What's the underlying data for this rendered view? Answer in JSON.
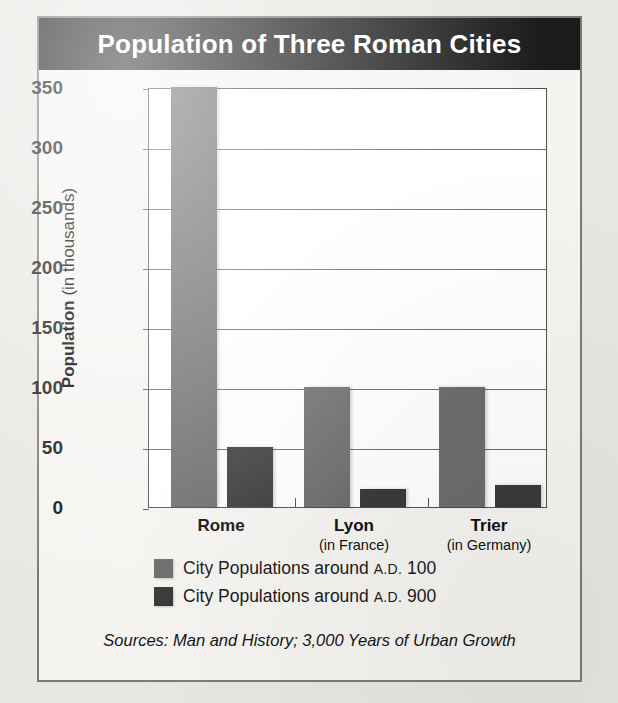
{
  "figure": {
    "title": "Population of Three Roman Cities",
    "source_note": "Sources: Man and History; 3,000 Years of Urban Growth",
    "colors": {
      "banner_background": "#1b1b1b",
      "banner_text": "#ffffff",
      "series_ad100": "#6d6c6b",
      "series_ad900": "#3b3a39",
      "frame_border": "#7c7a76",
      "plot_background": "#ffffff",
      "gridline": "#6d6b68",
      "page_background": "#e9e7e3",
      "figure_background": "#f5f4f1"
    }
  },
  "axis": {
    "y_title_bold": "Population",
    "y_title_plain": "(in thousands)",
    "y_ticks": [
      "0",
      "50",
      "100",
      "150",
      "200",
      "250",
      "300",
      "350"
    ]
  },
  "legend": {
    "items": [
      {
        "swatch": "light",
        "prefix": "City Populations around ",
        "era": "A.D.",
        "year": " 100"
      },
      {
        "swatch": "dark",
        "prefix": "City Populations around ",
        "era": "A.D.",
        "year": " 900"
      }
    ]
  },
  "categories": [
    {
      "name": "Rome",
      "sub": ""
    },
    {
      "name": "Lyon",
      "sub": "(in France)"
    },
    {
      "name": "Trier",
      "sub": "(in Germany)"
    }
  ],
  "chart_data": {
    "type": "bar",
    "title": "Population of Three Roman Cities",
    "xlabel": "",
    "ylabel": "Population (in thousands)",
    "ylim": [
      0,
      350
    ],
    "yticks": [
      0,
      50,
      100,
      150,
      200,
      250,
      300,
      350
    ],
    "grid": true,
    "legend_position": "below-plot-left",
    "categories": [
      "Rome",
      "Lyon",
      "Trier"
    ],
    "category_subtitles": [
      "",
      "(in France)",
      "(in Germany)"
    ],
    "series": [
      {
        "name": "City Populations around A.D. 100",
        "color": "#6d6c6b",
        "values": [
          350,
          100,
          100
        ]
      },
      {
        "name": "City Populations around A.D. 900",
        "color": "#3b3a39",
        "values": [
          50,
          15,
          18
        ]
      }
    ],
    "units": "thousands of people",
    "source": "Sources: Man and History; 3,000 Years of Urban Growth"
  }
}
